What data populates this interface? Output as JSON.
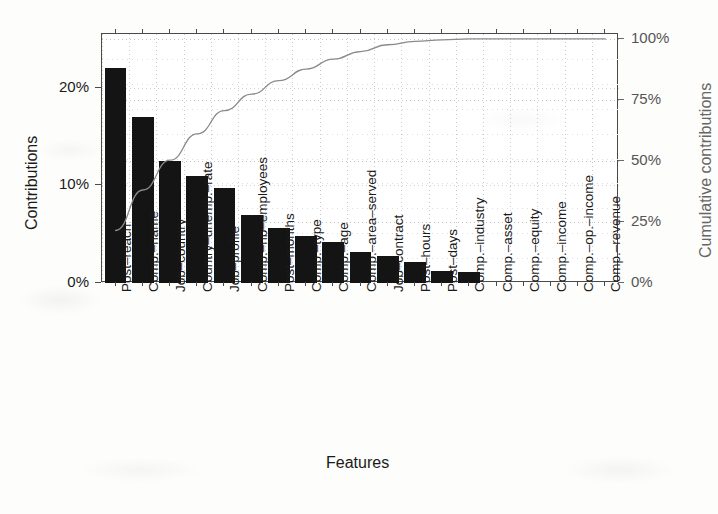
{
  "chart_data": {
    "type": "bar",
    "title": "",
    "xlabel": "Features",
    "ylabel": "Contributions",
    "y2label": "Cumulative contributions",
    "grid": true,
    "legend_position": "none",
    "ylim": [
      0,
      25.5
    ],
    "y2lim": [
      0,
      102
    ],
    "yticks": [
      "0%",
      "10%",
      "20%"
    ],
    "ytick_values": [
      0,
      10,
      20
    ],
    "y2ticks": [
      "0%",
      "25%",
      "50%",
      "75%",
      "100%"
    ],
    "y2tick_values": [
      0,
      25,
      50,
      75,
      100
    ],
    "categories": [
      "Post–reach",
      "Comp.–name",
      "Job–country",
      "Country–unemp.–rate",
      "Job–profile",
      "Comp.–nb–employees",
      "Post–months",
      "Comp.–type",
      "Comp.–age",
      "Comp.–area–served",
      "Job–contract",
      "Post–hours",
      "Post–days",
      "Comp.–industry",
      "Comp.–asset",
      "Comp.–equity",
      "Comp.–income",
      "Comp.–op.–income",
      "Comp.–revenue"
    ],
    "series": [
      {
        "name": "Contributions",
        "axis": "left",
        "type": "bar",
        "color": "#141414",
        "values": [
          22.0,
          17.0,
          12.5,
          11.0,
          9.7,
          7.0,
          5.6,
          4.8,
          4.2,
          3.2,
          2.8,
          2.2,
          1.2,
          1.1,
          0.0,
          0.0,
          0.0,
          0.0,
          0.0
        ]
      },
      {
        "name": "Cumulative contributions",
        "axis": "right",
        "type": "line",
        "color": "#8a8a8a",
        "values": [
          21.5,
          38.1,
          50.3,
          61.1,
          70.6,
          77.4,
          82.9,
          87.6,
          91.7,
          94.8,
          97.6,
          99.0,
          99.6,
          100.0,
          100.0,
          100.0,
          100.0,
          100.0,
          100.0
        ]
      }
    ]
  },
  "axes": {
    "left_title": "Contributions",
    "right_title": "Cumulative contributions",
    "bottom_title": "Features"
  }
}
